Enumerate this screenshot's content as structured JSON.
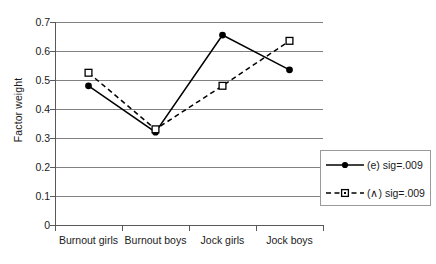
{
  "chart_data": {
    "type": "line",
    "title": "",
    "xlabel": "",
    "ylabel": "Factor weight",
    "categories": [
      "Burnout girls",
      "Burnout boys",
      "Jock girls",
      "Jock boys"
    ],
    "ylim": [
      0,
      0.7
    ],
    "yticks": [
      "0",
      "0.1",
      "0.2",
      "0.3",
      "0.4",
      "0.5",
      "0.6",
      "0.7"
    ],
    "ytick_values": [
      0,
      0.1,
      0.2,
      0.3,
      0.4,
      0.5,
      0.6,
      0.7
    ],
    "grid": "horizontal",
    "legend_position": "bottom-right",
    "series": [
      {
        "name": "(e) sig=.009",
        "values": [
          0.48,
          0.32,
          0.655,
          0.535
        ],
        "line_style": "solid",
        "marker": "filled-circle",
        "color": "#000000"
      },
      {
        "name": "(∧) sig=.009",
        "values": [
          0.525,
          0.33,
          0.48,
          0.635
        ],
        "line_style": "dashed",
        "marker": "open-square",
        "color": "#000000"
      }
    ]
  },
  "colors": {
    "gridline": "#808080",
    "axis": "#595959",
    "series": "#000000",
    "legend_border": "#9a9a9a",
    "background": "#ffffff"
  }
}
